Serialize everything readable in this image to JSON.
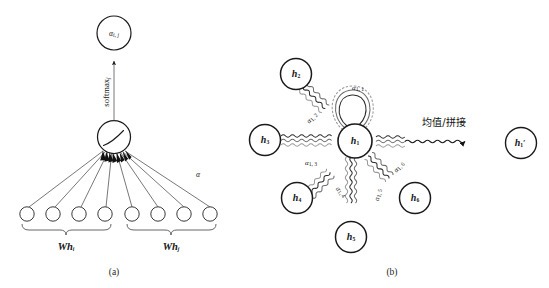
{
  "figure": {
    "background_color": "#ffffff",
    "ink_color": "#1a1a1a",
    "edge_color": "#55555a",
    "panels": [
      {
        "id": "a",
        "caption": "(a)",
        "title": "attention mechanism"
      },
      {
        "id": "b",
        "caption": "(b)",
        "title": "multi-head attention aggregation"
      }
    ]
  },
  "panel_a": {
    "caption": "(a)",
    "output_node": {
      "name": "alpha-ij-node",
      "symbol": "α",
      "subscript": "i, j"
    },
    "softmax_label": {
      "text": "softmax",
      "subscript": "j"
    },
    "activation_node": {
      "name": "leakyrelu-node",
      "glyph": "leaky-relu-curve"
    },
    "attention_vector_label": "α",
    "input_nodes": [
      {
        "index": 1,
        "group": "Whi"
      },
      {
        "index": 2,
        "group": "Whi"
      },
      {
        "index": 3,
        "group": "Whi"
      },
      {
        "index": 4,
        "group": "Whi"
      },
      {
        "index": 5,
        "group": "Whj"
      },
      {
        "index": 6,
        "group": "Whj"
      },
      {
        "index": 7,
        "group": "Whj"
      },
      {
        "index": 8,
        "group": "Whj"
      }
    ],
    "groups": [
      {
        "name": "left-group",
        "symbol": "Wh",
        "subscript": "i"
      },
      {
        "name": "right-group",
        "symbol": "Wh",
        "subscript": "j"
      }
    ]
  },
  "panel_b": {
    "caption": "(b)",
    "center_node": {
      "symbol": "h",
      "subscript": "1",
      "prime": false
    },
    "output_node": {
      "symbol": "h",
      "subscript": "1",
      "prime": true
    },
    "aggregation_label": "均值/拼接",
    "neighbor_nodes": [
      {
        "symbol": "h",
        "subscript": "2"
      },
      {
        "symbol": "h",
        "subscript": "3"
      },
      {
        "symbol": "h",
        "subscript": "4"
      },
      {
        "symbol": "h",
        "subscript": "5"
      },
      {
        "symbol": "h",
        "subscript": "6"
      }
    ],
    "attention_edges": [
      {
        "symbol": "α",
        "subscript": "1, 1",
        "target": "self-loop"
      },
      {
        "symbol": "α",
        "subscript": "1, 2",
        "target": "h2"
      },
      {
        "symbol": "α",
        "subscript": "1, 3",
        "target": "h3"
      },
      {
        "symbol": "α",
        "subscript": "1, 4",
        "target": "h4"
      },
      {
        "symbol": "α",
        "subscript": "1, 5",
        "target": "h5"
      },
      {
        "symbol": "α",
        "subscript": "1, 6",
        "target": "h6"
      }
    ],
    "head_colors": [
      "#2b2b2b",
      "#6d6d6d",
      "#9a9a9a"
    ],
    "num_heads": 3
  }
}
